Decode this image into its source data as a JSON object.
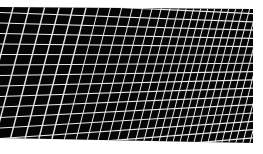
{
  "image": {
    "subject": "solar panel grid close-up",
    "background_color": "#ffffff",
    "panel_color": "#050505",
    "grid_line_color": "#e8e8e8"
  }
}
